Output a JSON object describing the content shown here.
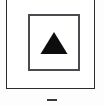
{
  "panel": {
    "name": "bordered-panel",
    "border_color": "#2b2b2f",
    "background_color": "#ffffff"
  },
  "swatch": {
    "name": "triangle-swatch",
    "border_color": "#4a4a50",
    "background_color": "#ffffff",
    "icon": "triangle-up-icon",
    "icon_color": "#0d0d0d",
    "label": ""
  },
  "caption": {
    "text": "",
    "color": "#3a3a3e"
  },
  "canvas": {
    "background_color": "#fdfdfd"
  }
}
